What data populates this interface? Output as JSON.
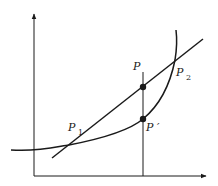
{
  "diagram": {
    "type": "convex-function-secant",
    "colors": {
      "stroke": "#1a1a1a",
      "background": "#ffffff"
    },
    "axes": {
      "x_axis": {
        "from": [
          34,
          176
        ],
        "to": [
          206,
          176
        ],
        "arrow": true
      },
      "y_axis": {
        "from": [
          34,
          176
        ],
        "to": [
          34,
          14
        ],
        "arrow": true
      }
    },
    "vertical_line": {
      "x": 143,
      "y_top": 72,
      "y_bottom": 176
    },
    "secant_line": {
      "from": [
        52,
        158
      ],
      "to": [
        203,
        39
      ]
    },
    "curve": {
      "path": "M 11 150 C 40 152, 60 146, 69 145 C 100 139, 130 130, 143 119 C 160 105, 170 85, 175 60 C 177 48, 177 38, 176 30"
    },
    "points": [
      {
        "id": "P",
        "x": 143,
        "y": 87,
        "filled": true
      },
      {
        "id": "P_prime",
        "x": 143,
        "y": 119,
        "filled": true
      }
    ],
    "labels": {
      "P": {
        "text": "P",
        "x": 133,
        "y": 70
      },
      "P1_main": {
        "text": "P",
        "x": 68,
        "y": 131
      },
      "P1_sub": {
        "text": "1",
        "x": 78,
        "y": 135
      },
      "P2_main": {
        "text": "P",
        "x": 176,
        "y": 76
      },
      "P2_sub": {
        "text": "2",
        "x": 186,
        "y": 80
      },
      "Pprime": {
        "text": "P ′",
        "x": 146,
        "y": 131
      }
    }
  }
}
